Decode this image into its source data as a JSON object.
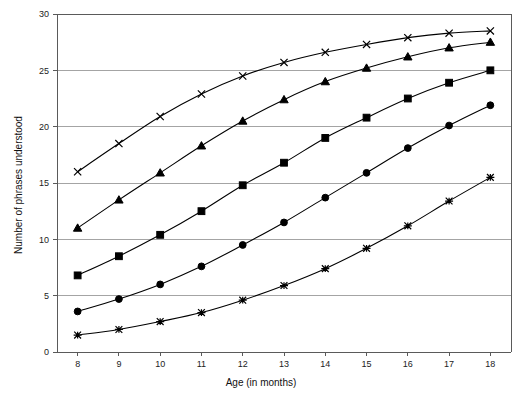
{
  "chart_data": {
    "type": "line",
    "title": "",
    "xlabel": "Age (in months)",
    "ylabel": "Number of phrases understood",
    "x": [
      8,
      9,
      10,
      11,
      12,
      13,
      14,
      15,
      16,
      17,
      18
    ],
    "xtick_labels": [
      "8",
      "9",
      "10",
      "11",
      "12",
      "13",
      "14",
      "15",
      "16",
      "17",
      "18"
    ],
    "ytick_labels": [
      "0",
      "5",
      "10",
      "15",
      "20",
      "25",
      "30"
    ],
    "yticks": [
      0,
      5,
      10,
      15,
      20,
      25,
      30
    ],
    "xlim": [
      7.5,
      18.5
    ],
    "ylim": [
      0,
      30
    ],
    "grid": "horizontal",
    "legend": "none",
    "series": [
      {
        "name": "series-1-cross",
        "marker": "cross-x",
        "values": [
          16.0,
          18.5,
          20.9,
          22.9,
          24.5,
          25.7,
          26.6,
          27.3,
          27.9,
          28.3,
          28.5
        ]
      },
      {
        "name": "series-2-triangle",
        "marker": "filled-triangle",
        "values": [
          11.0,
          13.5,
          15.9,
          18.3,
          20.5,
          22.4,
          24.0,
          25.2,
          26.2,
          27.0,
          27.5
        ]
      },
      {
        "name": "series-3-square",
        "marker": "filled-square",
        "values": [
          6.8,
          8.5,
          10.4,
          12.5,
          14.8,
          16.8,
          19.0,
          20.8,
          22.5,
          23.9,
          25.0
        ]
      },
      {
        "name": "series-4-circle",
        "marker": "filled-circle",
        "values": [
          3.6,
          4.7,
          6.0,
          7.6,
          9.5,
          11.5,
          13.7,
          15.9,
          18.1,
          20.1,
          21.9
        ]
      },
      {
        "name": "series-5-asterisk",
        "marker": "asterisk",
        "values": [
          1.5,
          2.0,
          2.7,
          3.5,
          4.6,
          5.9,
          7.4,
          9.2,
          11.2,
          13.4,
          15.5
        ]
      }
    ]
  },
  "axes": {
    "x_title": "Age (in months)",
    "y_title": "Number of phrases understood"
  },
  "colors": {
    "ink": "#000000",
    "grid": "#9a9a9a",
    "axis": "#5a5a5a",
    "background": "#ffffff"
  }
}
